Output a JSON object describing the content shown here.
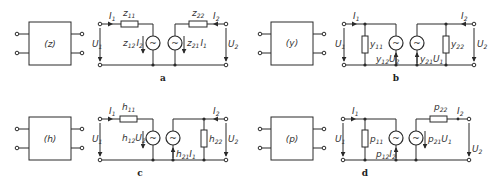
{
  "panels": [
    {
      "id": "a",
      "caption": "a",
      "box_label": "(z)",
      "labels": {
        "I1": "I",
        "I1_sub": "1",
        "I2": "I",
        "I2_sub": "2",
        "U1": "U",
        "U1_sub": "1",
        "U2": "U",
        "U2_sub": "2",
        "r1": "z",
        "r1_sub": "11",
        "r2": "z",
        "r2_sub": "22",
        "s1": "z",
        "s1_sub": "12",
        "s1_var": "I",
        "s1_var_sub": "2",
        "s2": "z",
        "s2_sub": "21",
        "s2_var": "I",
        "s2_var_sub": "1"
      }
    },
    {
      "id": "b",
      "caption": "b",
      "box_label": "(y)",
      "labels": {
        "I1": "I",
        "I1_sub": "1",
        "I2": "I",
        "I2_sub": "2",
        "U1": "U",
        "U1_sub": "1",
        "U2": "U",
        "U2_sub": "2",
        "r1": "y",
        "r1_sub": "11",
        "r2": "y",
        "r2_sub": "22",
        "s1": "y",
        "s1_sub": "12",
        "s1_var": "U",
        "s1_var_sub": "2",
        "s2": "y",
        "s2_sub": "21",
        "s2_var": "U",
        "s2_var_sub": "1"
      }
    },
    {
      "id": "c",
      "caption": "c",
      "box_label": "(h)",
      "labels": {
        "I1": "I",
        "I1_sub": "1",
        "I2": "I",
        "I2_sub": "2",
        "U1": "U",
        "U1_sub": "1",
        "U2": "U",
        "U2_sub": "2",
        "r1": "h",
        "r1_sub": "11",
        "r2": "h",
        "r2_sub": "22",
        "s1": "h",
        "s1_sub": "12",
        "s1_var": "U",
        "s1_var_sub": "2",
        "s2": "h",
        "s2_sub": "21",
        "s2_var": "I",
        "s2_var_sub": "1"
      }
    },
    {
      "id": "d",
      "caption": "d",
      "box_label": "(p)",
      "labels": {
        "I1": "I",
        "I1_sub": "1",
        "I2": "I",
        "I2_sub": "2",
        "U1": "U",
        "U1_sub": "1",
        "U2": "U",
        "U2_sub": "2",
        "r1": "p",
        "r1_sub": "11",
        "r2": "p",
        "r2_sub": "22",
        "s1": "p",
        "s1_sub": "12",
        "s1_var": "I",
        "s1_var_sub": "2",
        "s2": "p",
        "s2_sub": "21",
        "s2_var": "U",
        "s2_var_sub": "1"
      }
    }
  ],
  "source_symbol": "~"
}
